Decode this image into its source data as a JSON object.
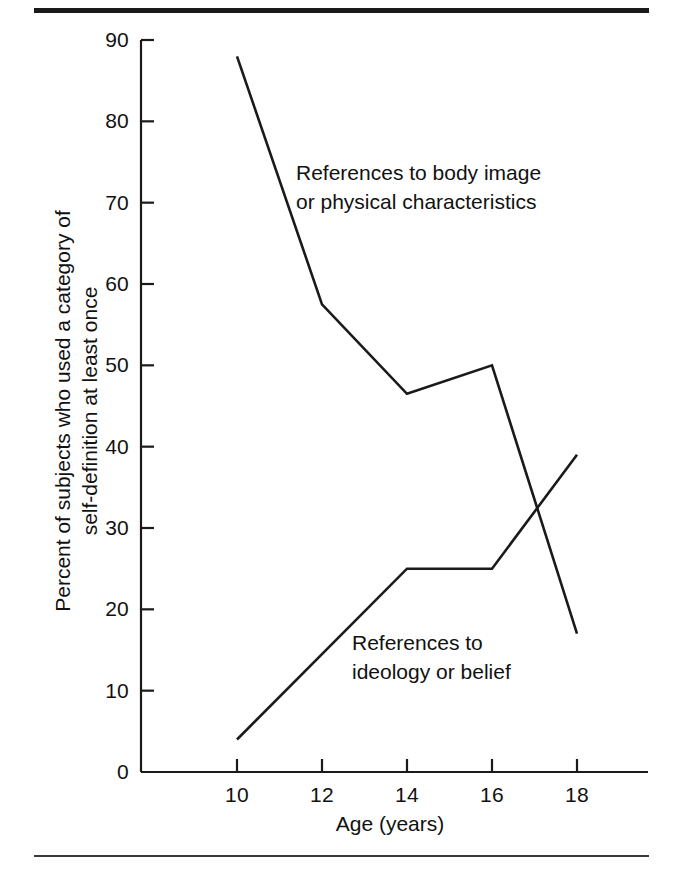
{
  "figure": {
    "has_top_rule": true,
    "has_bottom_rule": true,
    "background_color": "#ffffff",
    "line_color": "#1a1a1a"
  },
  "axis": {
    "x_title": "Age (years)",
    "y_title_line1": "Percent of subjects who used a category of",
    "y_title_line2": "self-definition at least once",
    "y_ticks": [
      "0",
      "10",
      "20",
      "30",
      "40",
      "50",
      "60",
      "70",
      "80",
      "90"
    ],
    "x_ticks": [
      "10",
      "12",
      "14",
      "16",
      "18"
    ]
  },
  "annotations": {
    "body_image": "References to body image\nor physical characteristics",
    "ideology": "References to\nideology or belief"
  },
  "chart_data": {
    "type": "line",
    "title": "",
    "subtitle": "",
    "xlabel": "Age (years)",
    "ylabel": "Percent of subjects who used a category of self-definition at least once",
    "x": [
      10,
      12,
      14,
      16,
      18
    ],
    "xlim": [
      9,
      19
    ],
    "ylim": [
      0,
      90
    ],
    "xticks": [
      10,
      12,
      14,
      16,
      18
    ],
    "yticks": [
      0,
      10,
      20,
      30,
      40,
      50,
      60,
      70,
      80,
      90
    ],
    "grid": false,
    "legend": "inline-annotations",
    "series": [
      {
        "name": "References to body image or physical characteristics",
        "values": [
          88,
          57.5,
          46.5,
          50,
          17
        ],
        "color": "#1a1a1a"
      },
      {
        "name": "References to ideology or belief",
        "values": [
          4,
          14.5,
          25,
          25,
          39
        ],
        "color": "#1a1a1a"
      }
    ]
  }
}
